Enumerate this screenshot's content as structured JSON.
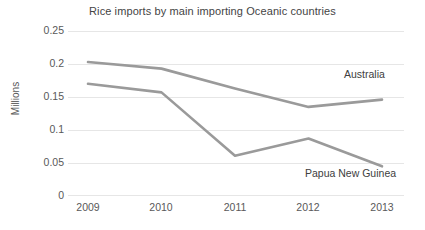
{
  "chart_data": {
    "type": "line",
    "title": "Rice imports by main importing Oceanic countries",
    "xlabel": "",
    "ylabel": "Millions",
    "categories": [
      "2009",
      "2010",
      "2011",
      "2012",
      "2013"
    ],
    "x": [
      2009,
      2010,
      2011,
      2012,
      2013
    ],
    "series": [
      {
        "name": "Australia",
        "values": [
          0.203,
          0.193,
          0.163,
          0.135,
          0.146
        ],
        "color": "#9a9a9a",
        "label_position": "right-of-line"
      },
      {
        "name": "Papua New Guinea",
        "values": [
          0.17,
          0.157,
          0.061,
          0.087,
          0.045
        ],
        "color": "#9a9a9a",
        "label_position": "below-right-of-line"
      }
    ],
    "ylim": [
      0,
      0.25
    ],
    "yticks": [
      0,
      0.05,
      0.1,
      0.15,
      0.2,
      0.25
    ],
    "ytick_labels": [
      "0",
      "0.05",
      "0.1",
      "0.15",
      "0.2",
      "0.25"
    ],
    "grid": "horizontal",
    "legend": "direct-labels",
    "background": "#ffffff",
    "gridline_color": "#e6e6e6",
    "text_color": "#595959"
  },
  "axes": {
    "y_tick_labels": [
      "0.25",
      "0.2",
      "0.15",
      "0.1",
      "0.05",
      "0"
    ],
    "x_tick_labels": [
      "2009",
      "2010",
      "2011",
      "2012",
      "2013"
    ],
    "y_title": "Millions"
  },
  "labels": {
    "title": "Rice imports by main importing Oceanic countries",
    "series_australia": "Australia",
    "series_png": "Papua New Guinea"
  }
}
